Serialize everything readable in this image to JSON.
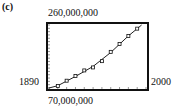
{
  "panel_label": "(c)",
  "chart_data": {
    "type": "scatter",
    "title": "",
    "xlabel": "",
    "ylabel": "",
    "x_window_labels": {
      "min": "1890",
      "max": "2000"
    },
    "y_window_labels": {
      "min": "70,000,000",
      "max": "260,000,000"
    },
    "xlim": [
      1890,
      2000
    ],
    "ylim": [
      70000000,
      260000000
    ],
    "grid": false,
    "tick_dots": true,
    "x_tick_step": 10,
    "y_tick_step": 10000000,
    "series": [
      {
        "name": "data",
        "x": [
          1900,
          1910,
          1920,
          1930,
          1940,
          1950,
          1960,
          1970,
          1980,
          1990
        ],
        "y": [
          76000000,
          92000000,
          106000000,
          123000000,
          132000000,
          151000000,
          179000000,
          203000000,
          227000000,
          249000000
        ]
      },
      {
        "name": "fitted curve",
        "type": "line",
        "x": [
          1890,
          1900,
          1920,
          1940,
          1960,
          1980,
          1995
        ],
        "y": [
          70000000,
          77000000,
          105000000,
          135000000,
          177000000,
          227000000,
          260000000
        ]
      }
    ]
  }
}
